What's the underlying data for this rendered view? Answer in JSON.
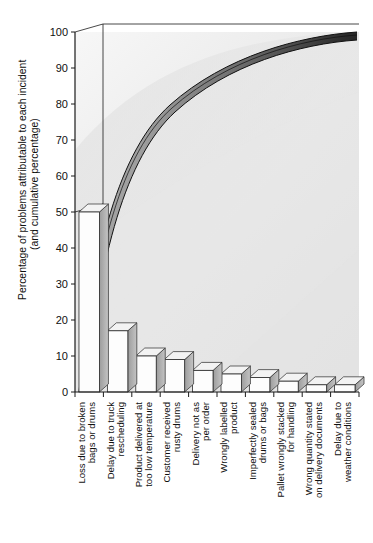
{
  "chart_data": {
    "type": "bar",
    "title": "",
    "subtitle": "",
    "xlabel": "",
    "ylabel": "Percentage of problems attributable to each incident",
    "ylabel_line2": "(and cumulative percentage)",
    "ylim": [
      0,
      100
    ],
    "yticks": [
      0,
      10,
      20,
      30,
      40,
      50,
      60,
      70,
      80,
      90,
      100
    ],
    "ytick_labels": [
      "0",
      "10",
      "20",
      "30",
      "40",
      "50",
      "60",
      "70",
      "80",
      "90",
      "100"
    ],
    "grid": false,
    "legend": "none",
    "style": "3d-pareto",
    "categories": [
      "Loss due to broken bags or drums",
      "Delay due to truck rescheduling",
      "Product delivered at too low temperature",
      "Customer received rusty drums",
      "Delivery not as per order",
      "Wrongly labelled product",
      "Imperfectly sealed drums or bags",
      "Pallet wrongly stacked for handling",
      "Wrong quantity stated on delivery documents",
      "Delay due to weather conditions"
    ],
    "category_lines": [
      [
        "Loss due to broken",
        "bags or drums"
      ],
      [
        "Delay due to truck",
        "rescheduling"
      ],
      [
        "Product delivered at",
        "too low temperature"
      ],
      [
        "Customer received",
        "rusty drums"
      ],
      [
        "Delivery not as",
        "per order"
      ],
      [
        "Wrongly labelled",
        "product"
      ],
      [
        "Imperfectly sealed",
        "drums or bags"
      ],
      [
        "Pallet wrongly stacked",
        "for handling"
      ],
      [
        "Wrong quantity stated",
        "on delivery documents"
      ],
      [
        "Delay due to",
        "weather conditions"
      ]
    ],
    "series": [
      {
        "name": "Percentage per incident",
        "kind": "bar",
        "values": [
          50,
          17,
          10,
          9,
          6,
          5,
          4,
          3,
          2,
          2
        ]
      },
      {
        "name": "Cumulative percentage",
        "kind": "line",
        "values": [
          50,
          67,
          77,
          86,
          92,
          97,
          99,
          99.5,
          100,
          100
        ]
      }
    ],
    "annotations": {
      "cumulative_start": 50,
      "cumulative_end": 100
    },
    "colors": {
      "bar_face": "#fdfdfd",
      "bar_side": "#8f8f8f",
      "bar_top": "#e2e2e2",
      "curve_line": "#1a1a1a",
      "curve_band_light": "#c9c9c9",
      "curve_band_dark": "#2b2b2b",
      "background": "#efefef",
      "axis": "#1a1a1a",
      "text": "#101010"
    }
  }
}
